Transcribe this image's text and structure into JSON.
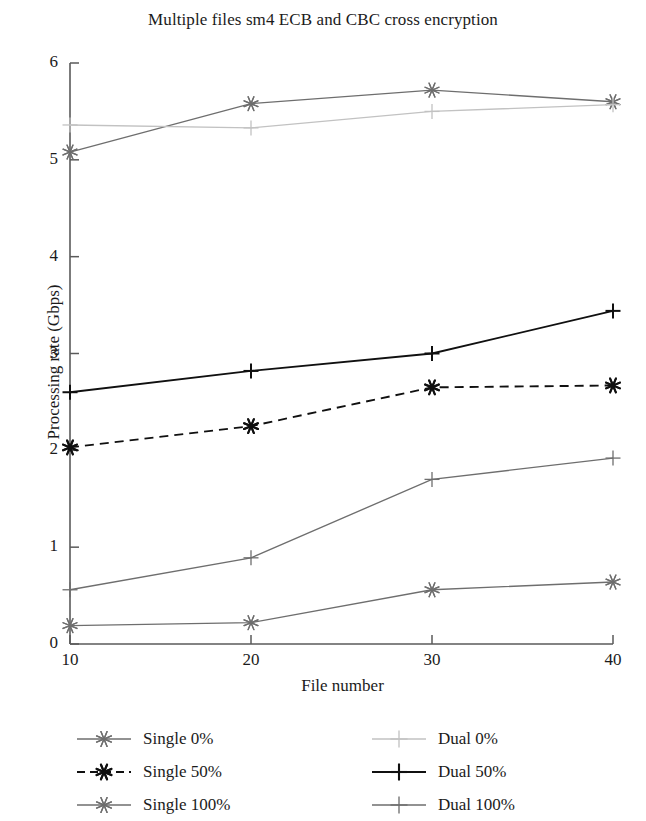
{
  "chart_data": {
    "type": "line",
    "title": "Multiple files sm4 ECB and CBC cross encryption",
    "xlabel": "File number",
    "ylabel": "Processing rate (Gbps)",
    "x": [
      10,
      20,
      30,
      40
    ],
    "xtick_labels": [
      "10",
      "20",
      "30",
      "40"
    ],
    "ytick_labels": [
      "0",
      "1",
      "2",
      "3",
      "4",
      "5",
      "6"
    ],
    "xlim": [
      10,
      40
    ],
    "ylim": [
      0,
      6
    ],
    "grid": false,
    "legend_position": "below-plot",
    "series": [
      {
        "name": "Single 0%",
        "values": [
          5.08,
          5.58,
          5.72,
          5.6
        ],
        "marker": "asterisk",
        "linestyle": "solid",
        "color": "#6e6e6e"
      },
      {
        "name": "Single 50%",
        "values": [
          2.03,
          2.25,
          2.65,
          2.67
        ],
        "marker": "asterisk",
        "linestyle": "dashed",
        "color": "#101010"
      },
      {
        "name": "Single 100%",
        "values": [
          0.19,
          0.22,
          0.56,
          0.64
        ],
        "marker": "asterisk",
        "linestyle": "solid",
        "color": "#6e6e6e"
      },
      {
        "name": "Dual 0%",
        "values": [
          5.36,
          5.33,
          5.5,
          5.57
        ],
        "marker": "plus",
        "linestyle": "solid",
        "color": "#c2c2c2"
      },
      {
        "name": "Dual 50%",
        "values": [
          2.6,
          2.82,
          3.0,
          3.44
        ],
        "marker": "plus",
        "linestyle": "solid",
        "color": "#101010"
      },
      {
        "name": "Dual 100%",
        "values": [
          0.56,
          0.89,
          1.7,
          1.92
        ],
        "marker": "plus",
        "linestyle": "solid",
        "color": "#6e6e6e"
      }
    ]
  },
  "legend": {
    "columns": [
      {
        "entries": [
          "Single 0%",
          "Single 50%",
          "Single 100%"
        ]
      },
      {
        "entries": [
          "Dual 0%",
          "Dual 50%",
          "Dual 100%"
        ]
      }
    ]
  },
  "axis": {
    "color": "#5a5a5a"
  }
}
